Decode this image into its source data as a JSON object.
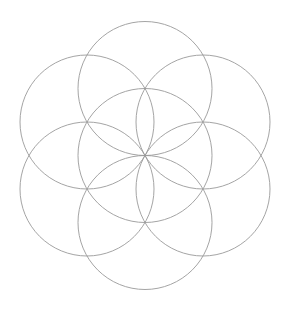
{
  "canvas": {
    "width": 285,
    "height": 311,
    "background_color": "#ffffff",
    "title": "Seed of Life"
  },
  "figure": {
    "name": "seed-of-life",
    "stroke_color": "#9a9a9a",
    "stroke_width": 0.9,
    "fill": "none",
    "center_x": 145,
    "center_y": 155.5,
    "radius": 67,
    "circle_count": 7,
    "orientation": "pointy-top",
    "ring_start_angle_deg": -90,
    "ring_angle_step_deg": 60,
    "bounds": {
      "left": 20,
      "top": 21,
      "right": 266,
      "bottom": 290
    },
    "circles": [
      {
        "id": "center",
        "label": "Center circle",
        "cx": 145.0,
        "cy": 155.5,
        "r": 67
      },
      {
        "id": "top",
        "label": "Top circle",
        "cx": 145.0,
        "cy": 88.5,
        "r": 67
      },
      {
        "id": "upper-right",
        "label": "Upper-right circle",
        "cx": 203.0,
        "cy": 122.0,
        "r": 67
      },
      {
        "id": "lower-right",
        "label": "Lower-right circle",
        "cx": 203.0,
        "cy": 189.0,
        "r": 67
      },
      {
        "id": "bottom",
        "label": "Bottom circle",
        "cx": 145.0,
        "cy": 222.5,
        "r": 67
      },
      {
        "id": "lower-left",
        "label": "Lower-left circle",
        "cx": 87.0,
        "cy": 189.0,
        "r": 67
      },
      {
        "id": "upper-left",
        "label": "Upper-left circle",
        "cx": 87.0,
        "cy": 122.0,
        "r": 67
      }
    ]
  }
}
